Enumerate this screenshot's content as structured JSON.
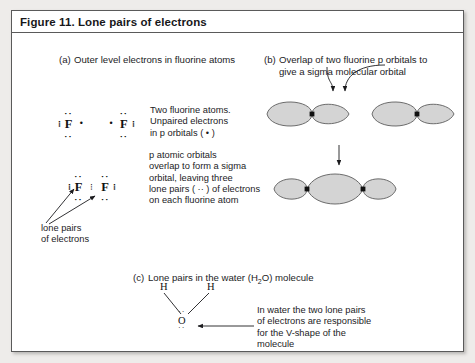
{
  "figure": {
    "title": "Figure 11. Lone pairs of electrons",
    "border_color": "#5a5a5a",
    "page_background": "#eeecea",
    "card_background": "#ffffff",
    "orbital_fill": "#d4d4d4",
    "orbital_stroke": "#5e5e5e"
  },
  "sections": {
    "a": {
      "tag": "(a)",
      "heading": "Outer level electrons in fluorine atoms"
    },
    "b": {
      "tag": "(b)",
      "heading_line1": "Overlap of two fluorine p orbitals to",
      "heading_line2": "give a sigma molecular orbital"
    },
    "c": {
      "tag": "(c)",
      "heading_pre": "Lone pairs in the water (H",
      "heading_sub": "2",
      "heading_post": "O) molecule"
    }
  },
  "lewis": {
    "fluorine_symbol": "F",
    "single_electron": "•",
    "lone_pair": "··",
    "atoms_row1": [
      "F",
      "F"
    ],
    "atoms_row2": [
      "F",
      "F"
    ]
  },
  "notes": {
    "note1": "Two fluorine atoms.\nUnpaired electrons\nin p orbitals ( • )",
    "note2": "p atomic orbitals\noverlap to form a sigma\norbital, leaving three\nlone pairs ( ·· ) of electrons\non each fluorine atom",
    "note3": "In water the two lone pairs\nof electrons are responsible\nfor the V-shape of the\nmolecule",
    "lone_pairs_label": "lone pairs\nof electrons"
  },
  "water": {
    "h_left": "H",
    "h_right": "H",
    "oxygen": "O",
    "lone_pair_dots": "··"
  },
  "icons": {
    "curved_arrow_left": "curved-arrow-left-icon",
    "curved_arrow_right": "curved-arrow-right-icon",
    "down_arrow": "down-arrow-icon",
    "pointer_arrow": "pointer-arrow-icon"
  }
}
